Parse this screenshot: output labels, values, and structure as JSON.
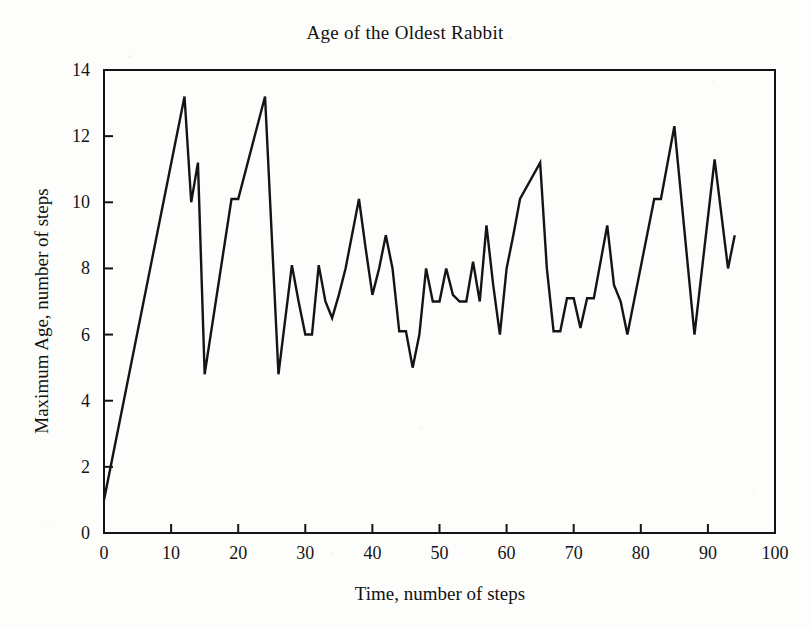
{
  "chart_data": {
    "type": "line",
    "title": "Age of the Oldest Rabbit",
    "xlabel": "Time, number of steps",
    "ylabel": "Maximum Age, number of steps",
    "xlim": [
      0,
      100
    ],
    "ylim": [
      0,
      14
    ],
    "xticks": [
      0,
      10,
      20,
      30,
      40,
      50,
      60,
      70,
      80,
      90,
      100
    ],
    "yticks": [
      0,
      2,
      4,
      6,
      8,
      10,
      12,
      14
    ],
    "xtick_labels": [
      "0",
      "10",
      "20",
      "30",
      "40",
      "50",
      "60",
      "70",
      "80",
      "90",
      "100"
    ],
    "ytick_labels": [
      "0",
      "2",
      "4",
      "6",
      "8",
      "10",
      "12",
      "14"
    ],
    "grid": false,
    "legend": false,
    "line_color": "#141414",
    "series": [
      {
        "name": "Maximum Age",
        "x": [
          0,
          12,
          13,
          14,
          15,
          19,
          20,
          24,
          26,
          28,
          29,
          30,
          31,
          32,
          33,
          34,
          35,
          36,
          38,
          39,
          40,
          41,
          42,
          43,
          44,
          45,
          46,
          47,
          48,
          49,
          50,
          51,
          52,
          53,
          54,
          55,
          56,
          57,
          58,
          59,
          60,
          61,
          62,
          65,
          66,
          67,
          68,
          69,
          70,
          71,
          72,
          73,
          75,
          76,
          77,
          78,
          82,
          83,
          85,
          88,
          91,
          93,
          94
        ],
        "y": [
          1.0,
          13.2,
          10.0,
          11.2,
          4.8,
          10.1,
          10.1,
          13.2,
          4.8,
          8.1,
          7.0,
          6.0,
          6.0,
          8.1,
          7.0,
          6.5,
          7.2,
          8.0,
          10.1,
          8.6,
          7.2,
          8.0,
          9.0,
          8.0,
          6.1,
          6.1,
          5.0,
          6.0,
          8.0,
          7.0,
          7.0,
          8.0,
          7.2,
          7.0,
          7.0,
          8.2,
          7.0,
          9.3,
          7.5,
          6.0,
          8.0,
          9.0,
          10.1,
          11.2,
          8.0,
          6.1,
          6.1,
          7.1,
          7.1,
          6.2,
          7.1,
          7.1,
          9.3,
          7.5,
          7.0,
          6.0,
          10.1,
          10.1,
          12.3,
          6.0,
          11.3,
          8.0,
          9.0
        ]
      }
    ]
  },
  "axes": {
    "tick_direction": "in",
    "frame": "box"
  }
}
